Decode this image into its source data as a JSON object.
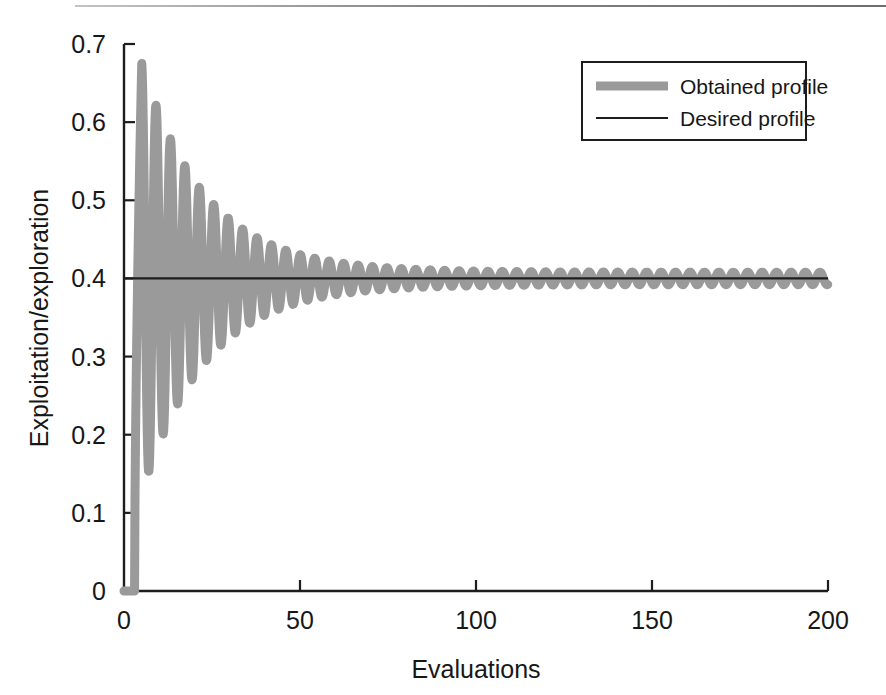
{
  "figure": {
    "background_color": "#ffffff",
    "page_rule_visible": true
  },
  "chart_data": {
    "type": "line",
    "title": "",
    "subtitle": "",
    "xlabel": "Evaluations",
    "ylabel": "Exploitation/exploration",
    "xlim": [
      0,
      200
    ],
    "ylim": [
      0,
      0.7
    ],
    "xticks": [
      0,
      50,
      100,
      150,
      200
    ],
    "xtick_labels": [
      "0",
      "50",
      "100",
      "150",
      "200"
    ],
    "yticks": [
      0,
      0.1,
      0.2,
      0.3,
      0.4,
      0.5,
      0.6,
      0.7
    ],
    "ytick_labels": [
      "0",
      "0.1",
      "0.2",
      "0.3",
      "0.4",
      "0.5",
      "0.6",
      "0.7"
    ],
    "grid": false,
    "legend_position": "top-right",
    "legend_entries": [
      {
        "label": "Obtained profile",
        "color": "#9a9a9a",
        "style": "thick-line",
        "line_width": 9
      },
      {
        "label": "Desired profile",
        "color": "#1d1d1d",
        "style": "thin-line",
        "line_width": 2
      }
    ],
    "series": [
      {
        "name": "Obtained profile",
        "color": "#9a9a9a",
        "description": "Damped oscillation converging to 0.4; rises from 0 at evaluation 3, overshoots to a peak of 0.668 near evaluation 5, then oscillates with exponentially decaying amplitude.",
        "initial_value": 0,
        "rise_start_x": 3,
        "peak": {
          "x": 5,
          "y": 0.668
        },
        "settling_value": 0.4,
        "envelope_decay_rate": 0.055,
        "oscillation_period": 4.1,
        "final_amplitude": 0.008,
        "points_x": [
          0,
          1,
          2,
          3,
          3.6,
          4.2,
          5,
          5.8,
          6.6,
          7.4,
          8.2,
          9,
          10,
          11,
          12,
          13,
          14,
          15,
          16,
          17,
          18,
          19,
          20,
          22,
          24,
          26,
          28,
          30,
          35,
          40,
          45,
          50,
          60,
          70,
          80,
          90,
          100,
          120,
          140,
          160,
          180,
          200
        ],
        "points_y": [
          0,
          0,
          0,
          0,
          0.38,
          0.6,
          0.668,
          0.56,
          0.36,
          0.332,
          0.4,
          0.5,
          0.497,
          0.355,
          0.345,
          0.5,
          0.47,
          0.39,
          0.355,
          0.44,
          0.465,
          0.4,
          0.362,
          0.455,
          0.42,
          0.377,
          0.44,
          0.43,
          0.425,
          0.418,
          0.383,
          0.424,
          0.417,
          0.414,
          0.412,
          0.41,
          0.409,
          0.406,
          0.404,
          0.403,
          0.402,
          0.398
        ]
      },
      {
        "name": "Desired profile",
        "color": "#1d1d1d",
        "description": "Constant reference level at 0.4 across the full evaluation range.",
        "constant_value": 0.4,
        "points_x": [
          0,
          200
        ],
        "points_y": [
          0.4,
          0.4
        ]
      }
    ]
  }
}
